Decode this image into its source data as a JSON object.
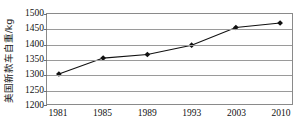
{
  "chart_data": {
    "type": "line",
    "title": "",
    "subtitle": "",
    "xlabel": "",
    "ylabel": "美国新款车自重/kg",
    "categories": [
      "1981",
      "1985",
      "1989",
      "1993",
      "2003",
      "2010"
    ],
    "x": [
      1981,
      1985,
      1989,
      1993,
      2003,
      2010
    ],
    "values": [
      1300,
      1353,
      1365,
      1396,
      1455,
      1470
    ],
    "series": [
      {
        "name": "美国新款车自重",
        "values": [
          1300,
          1353,
          1365,
          1396,
          1455,
          1470
        ]
      }
    ],
    "ylim": [
      1200,
      1500
    ],
    "yticks": [
      1500,
      1450,
      1400,
      1350,
      1300,
      1250,
      1200
    ],
    "ytick_labels": [
      "1500",
      "1450",
      "1400",
      "1350",
      "1300",
      "1250",
      "1200"
    ],
    "xtick_labels": [
      "1981",
      "1985",
      "1989",
      "1993",
      "2003",
      "2010"
    ],
    "grid": "horizontal",
    "legend": "none",
    "marker": "diamond",
    "line_color": "#111111",
    "marker_color": "#111111",
    "grid_color": "#9a9a9a",
    "frame_color": "#8a8a8a",
    "background_color": "#ffffff"
  }
}
